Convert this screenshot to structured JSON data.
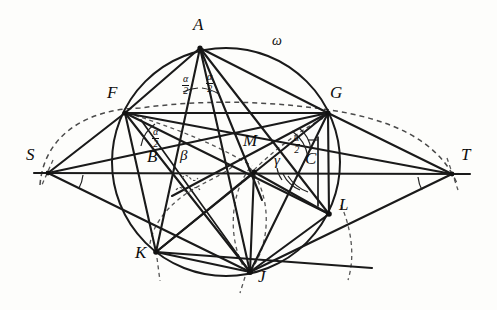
{
  "figure": {
    "background_color": "#fdfdfb",
    "ink_color": "#1a1a1a",
    "dashed_color": "#4a4a4a",
    "width": 497,
    "height": 310
  },
  "labels": {
    "A": "A",
    "B": "B",
    "C": "C",
    "F": "F",
    "G": "G",
    "J": "J",
    "K": "K",
    "L": "L",
    "M": "M",
    "S": "S",
    "T": "T",
    "omega": "ω",
    "beta": "β",
    "gamma": "γ",
    "alpha_num": "α",
    "alpha_den": "2"
  },
  "points": [
    {
      "name": "A",
      "x": 200,
      "y": 48,
      "label_x": 193,
      "label_y": 22
    },
    {
      "name": "F",
      "x": 125,
      "y": 113,
      "label_x": 110,
      "label_y": 88
    },
    {
      "name": "G",
      "x": 328,
      "y": 113,
      "label_x": 333,
      "label_y": 88
    },
    {
      "name": "S",
      "x": 48,
      "y": 173,
      "label_x": 27,
      "label_y": 149
    },
    {
      "name": "T",
      "x": 452,
      "y": 174,
      "label_x": 461,
      "label_y": 148
    },
    {
      "name": "B",
      "x": 178,
      "y": 173,
      "label_x": 150,
      "label_y": 150
    },
    {
      "name": "C",
      "x": 300,
      "y": 173,
      "label_x": 306,
      "label_y": 151
    },
    {
      "name": "M",
      "x": 254,
      "y": 172,
      "label_x": 243,
      "label_y": 134
    },
    {
      "name": "K",
      "x": 156,
      "y": 252,
      "label_x": 138,
      "label_y": 249
    },
    {
      "name": "L",
      "x": 329,
      "y": 214,
      "label_x": 340,
      "label_y": 196
    },
    {
      "name": "J",
      "x": 250,
      "y": 272,
      "label_x": 259,
      "label_y": 271
    }
  ],
  "circle": {
    "name": "omega",
    "center_x": 226,
    "center_y": 162,
    "radius": 114,
    "label_x": 276,
    "label_y": 38
  },
  "angle_labels": [
    {
      "name": "alpha-half-left-at-A",
      "x": 186,
      "y": 80,
      "kind": "fraction"
    },
    {
      "name": "alpha-half-right-at-A",
      "x": 210,
      "y": 78,
      "kind": "fraction"
    },
    {
      "name": "alpha-half-at-F",
      "x": 155,
      "y": 132,
      "kind": "fraction"
    },
    {
      "name": "alpha-half-at-G",
      "x": 296,
      "y": 137,
      "kind": "fraction"
    },
    {
      "name": "beta",
      "x": 183,
      "y": 151,
      "kind": "greek",
      "text": "β"
    },
    {
      "name": "gamma",
      "x": 277,
      "y": 155,
      "kind": "greek",
      "text": "γ"
    }
  ],
  "segments": [
    {
      "name": "line-ST",
      "from": [
        36,
        173
      ],
      "to": [
        468,
        174
      ]
    },
    {
      "name": "seg-SF",
      "from": [
        48,
        173
      ],
      "to": [
        125,
        113
      ]
    },
    {
      "name": "seg-FG",
      "from": [
        125,
        113
      ],
      "to": [
        328,
        113
      ]
    },
    {
      "name": "seg-GT",
      "from": [
        328,
        113
      ],
      "to": [
        452,
        174
      ]
    },
    {
      "name": "seg-SJ",
      "from": [
        48,
        173
      ],
      "to": [
        250,
        272
      ]
    },
    {
      "name": "seg-JT",
      "from": [
        250,
        272
      ],
      "to": [
        452,
        174
      ]
    },
    {
      "name": "seg-AF",
      "from": [
        200,
        48
      ],
      "to": [
        125,
        113
      ]
    },
    {
      "name": "seg-AG",
      "from": [
        200,
        48
      ],
      "to": [
        328,
        113
      ]
    },
    {
      "name": "seg-AB",
      "from": [
        200,
        48
      ],
      "to": [
        178,
        173
      ]
    },
    {
      "name": "seg-AM",
      "from": [
        200,
        48
      ],
      "to": [
        254,
        172
      ]
    },
    {
      "name": "seg-AJ",
      "from": [
        200,
        48
      ],
      "to": [
        250,
        272
      ]
    },
    {
      "name": "seg-AK",
      "from": [
        200,
        48
      ],
      "to": [
        156,
        252
      ]
    },
    {
      "name": "seg-AL",
      "from": [
        200,
        48
      ],
      "to": [
        329,
        214
      ]
    },
    {
      "name": "seg-FM",
      "from": [
        125,
        113
      ],
      "to": [
        254,
        172
      ]
    },
    {
      "name": "seg-FK",
      "from": [
        125,
        113
      ],
      "to": [
        156,
        252
      ]
    },
    {
      "name": "seg-FJ",
      "from": [
        125,
        113
      ],
      "to": [
        250,
        272
      ]
    },
    {
      "name": "seg-FL",
      "from": [
        125,
        113
      ],
      "to": [
        329,
        214
      ]
    },
    {
      "name": "seg-GM",
      "from": [
        328,
        113
      ],
      "to": [
        254,
        172
      ]
    },
    {
      "name": "seg-GL",
      "from": [
        328,
        113
      ],
      "to": [
        329,
        214
      ]
    },
    {
      "name": "seg-GJ",
      "from": [
        328,
        113
      ],
      "to": [
        250,
        272
      ]
    },
    {
      "name": "seg-GK",
      "from": [
        328,
        113
      ],
      "to": [
        156,
        252
      ]
    },
    {
      "name": "seg-MJ",
      "from": [
        254,
        172
      ],
      "to": [
        250,
        272
      ]
    },
    {
      "name": "seg-MK",
      "from": [
        254,
        172
      ],
      "to": [
        156,
        252
      ]
    },
    {
      "name": "seg-ML",
      "from": [
        254,
        172
      ],
      "to": [
        329,
        214
      ]
    },
    {
      "name": "seg-KJ",
      "from": [
        156,
        252
      ],
      "to": [
        250,
        272
      ]
    },
    {
      "name": "seg-JL",
      "from": [
        250,
        272
      ],
      "to": [
        329,
        214
      ]
    },
    {
      "name": "seg-KL-extended",
      "from": [
        150,
        268
      ],
      "to": [
        372,
        264
      ]
    }
  ]
}
